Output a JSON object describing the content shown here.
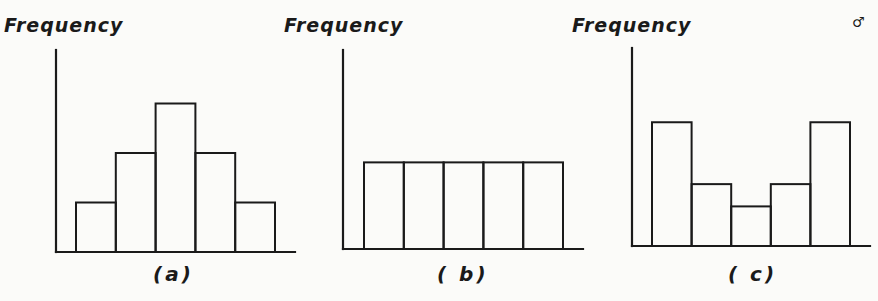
{
  "chart_data": [
    {
      "type": "bar",
      "subtype": "histogram",
      "panel": "(a)",
      "ylabel": "Frequency",
      "xlabel": "",
      "caption": "(a)",
      "shape": "symmetric / unimodal (bell-shaped)",
      "categories": [
        "1",
        "2",
        "3",
        "4",
        "5"
      ],
      "values": [
        1,
        2,
        3,
        2,
        1
      ],
      "pixel_heights": [
        49,
        96,
        149,
        97,
        50
      ],
      "ylim": [
        0,
        3.2
      ],
      "grid": false,
      "ticks": false
    },
    {
      "type": "bar",
      "subtype": "histogram",
      "panel": "(b)",
      "ylabel": "Frequency",
      "xlabel": "",
      "caption": "(b)",
      "shape": "uniform / rectangular",
      "categories": [
        "1",
        "2",
        "3",
        "4",
        "5"
      ],
      "values": [
        1.75,
        1.75,
        1.75,
        1.75,
        1.75
      ],
      "pixel_heights": [
        87,
        87,
        87,
        87,
        87
      ],
      "ylim": [
        0,
        3.2
      ],
      "grid": false,
      "ticks": false
    },
    {
      "type": "bar",
      "subtype": "histogram",
      "panel": "(c)",
      "ylabel": "Frequency",
      "xlabel": "",
      "caption": "(c)",
      "shape": "U-shaped / bimodal",
      "categories": [
        "1",
        "2",
        "3",
        "4",
        "5"
      ],
      "values": [
        2.5,
        1.25,
        0.8,
        1.25,
        2.5
      ],
      "pixel_heights": [
        124,
        61,
        40,
        62,
        126
      ],
      "ylim": [
        0,
        3.2
      ],
      "grid": false,
      "ticks": false
    }
  ],
  "panels": [
    {
      "ylabel": "Frequency",
      "caption": "(a)"
    },
    {
      "ylabel": "Frequency",
      "caption": "( b)"
    },
    {
      "ylabel": "Frequency",
      "caption": "( c)"
    }
  ],
  "corner_mark": "♂"
}
